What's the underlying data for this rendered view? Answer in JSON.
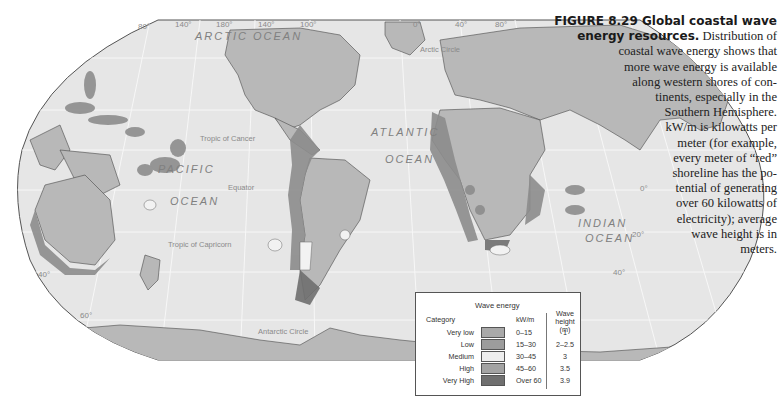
{
  "figure": {
    "number": "FIGURE 8.29",
    "title": "Global coastal wave energy resources.",
    "caption_lines": [
      {
        "text": "FIGURE 8.29 Global coastal wave",
        "bold": true
      },
      {
        "text": "energy resources.",
        "bold": true,
        "suffix": " Distribution of"
      },
      {
        "text": "coastal wave energy shows that"
      },
      {
        "text": "more wave energy is available"
      },
      {
        "text": "along western shores of con-"
      },
      {
        "text": "tinents, especially in the"
      },
      {
        "text": "Southern Hemisphere."
      },
      {
        "text": "kW/m is kilowatts per"
      },
      {
        "text": "meter (for example,"
      },
      {
        "text": "every meter of “red”"
      },
      {
        "text": "shoreline has the po-"
      },
      {
        "text": "tential of generating"
      },
      {
        "text": "over 60 kilowatts of"
      },
      {
        "text": "electricity); average"
      },
      {
        "text": "wave height is in"
      },
      {
        "text": "meters."
      }
    ]
  },
  "map": {
    "ocean_labels": {
      "arctic": "ARCTIC OCEAN",
      "pacific_1": "PACIFIC",
      "pacific_2": "OCEAN",
      "atlantic_1": "ATLANTIC",
      "atlantic_2": "OCEAN",
      "indian_1": "INDIAN",
      "indian_2": "OCEAN"
    },
    "line_labels": {
      "arctic_circle": "Arctic Circle",
      "tropic_cancer": "Tropic of Cancer",
      "equator": "Equator",
      "tropic_capricorn": "Tropic of Capricorn",
      "antarctic_circle": "Antarctic Circle"
    },
    "longitude_labels": [
      "80°",
      "140°",
      "180°",
      "140°",
      "100°",
      "0°",
      "40°",
      "80°"
    ],
    "latitude_labels": {
      "left_40": "40°",
      "left_60": "60°",
      "right_0": "0°",
      "right_20": "20°",
      "right_40": "40°"
    },
    "colors": {
      "ocean": "#e6e6e6",
      "land": "#b8b8b8",
      "border": "#4a4a4a",
      "grid": "#f6f6f6"
    }
  },
  "legend": {
    "title": "Wave energy",
    "category_header": "Category",
    "kw_header": "kW/m",
    "height_header_1": "Wave",
    "height_header_2": "height (m)",
    "rows": [
      {
        "category": "Very low",
        "kw": "0–15",
        "height": "1",
        "color": "#a9a9a9"
      },
      {
        "category": "Low",
        "kw": "15–30",
        "height": "2–2.5",
        "color": "#9c9c9c"
      },
      {
        "category": "Medium",
        "kw": "30–45",
        "height": "3",
        "color": "#eeeeee"
      },
      {
        "category": "High",
        "kw": "45–60",
        "height": "3.5",
        "color": "#a3a3a3"
      },
      {
        "category": "Very High",
        "kw": "Over 60",
        "height": "3.9",
        "color": "#6f6f6f"
      }
    ]
  }
}
